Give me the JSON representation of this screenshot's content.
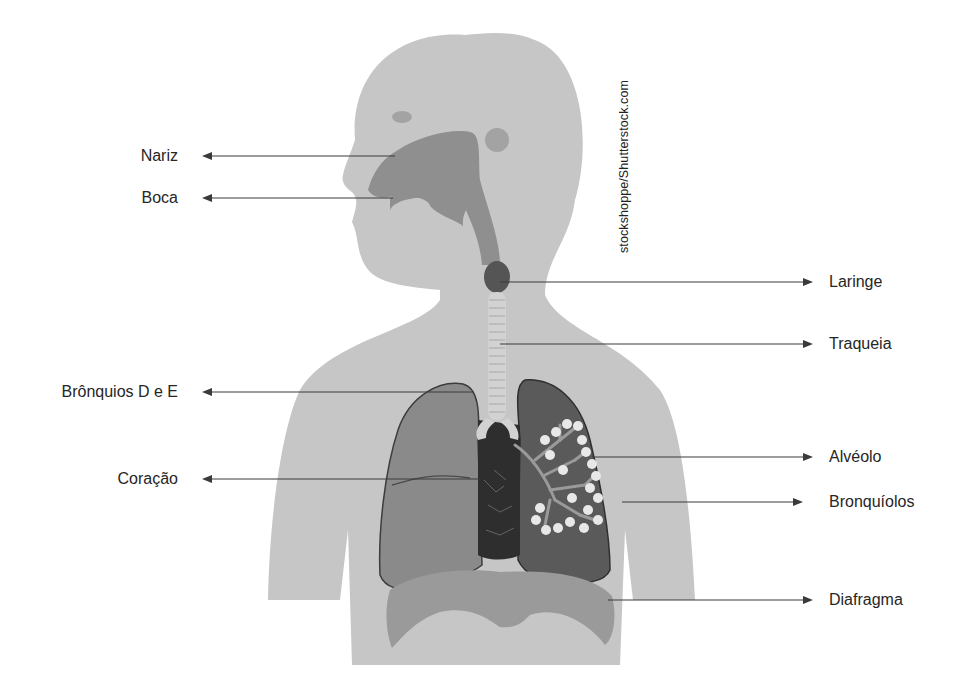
{
  "diagram": {
    "watermark": "stockshoppe/Shutterstock.com",
    "colors": {
      "background": "#ffffff",
      "body_silhouette": "#c6c6c6",
      "airway": "#8f8f8f",
      "larynx": "#555555",
      "trachea_rings": "#d2d2d2",
      "right_lung": "#8a8a8a",
      "left_lung": "#5a5a5a",
      "heart": "#2e2e2e",
      "alveoli": "#e8e8e8",
      "diaphragm": "#9a9a9a",
      "leader_line": "#3a3a3a",
      "label_text": "#262626"
    },
    "labels_left": [
      {
        "id": "nariz",
        "text": "Nariz"
      },
      {
        "id": "boca",
        "text": "Boca"
      },
      {
        "id": "bronquios",
        "text": "Brônquios D e E"
      },
      {
        "id": "coracao",
        "text": "Coração"
      }
    ],
    "labels_right": [
      {
        "id": "laringe",
        "text": "Laringe"
      },
      {
        "id": "traqueia",
        "text": "Traqueia"
      },
      {
        "id": "alveolo",
        "text": "Alvéolo"
      },
      {
        "id": "bronquiolos",
        "text": "Bronquíolos"
      },
      {
        "id": "diafragma",
        "text": "Diafragma"
      }
    ]
  }
}
